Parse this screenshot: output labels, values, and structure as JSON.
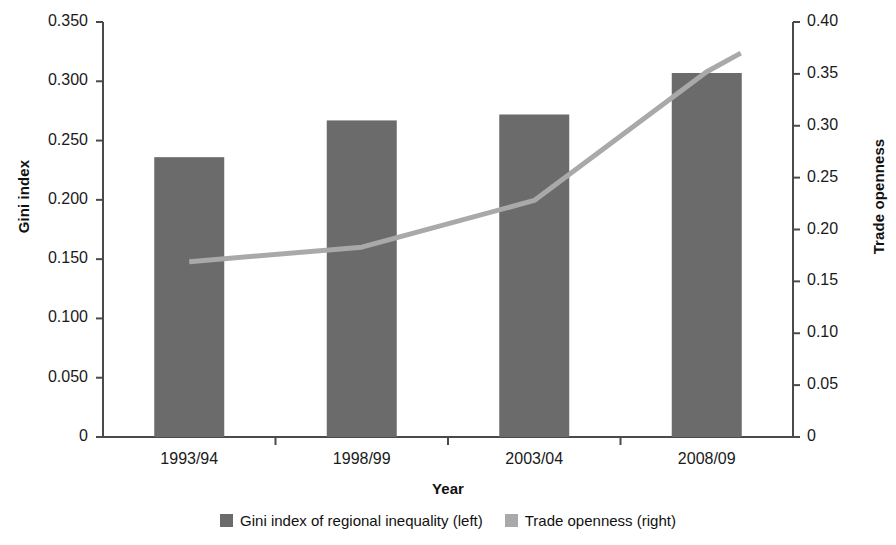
{
  "chart_data": {
    "type": "bar",
    "title": "",
    "subtitle": "",
    "xlabel": "Year",
    "ylabel": "Gini index",
    "y2label": "Trade openness",
    "categories": [
      "1993/94",
      "1998/99",
      "2003/04",
      "2008/09"
    ],
    "ylim": [
      0,
      0.35
    ],
    "y2lim": [
      0,
      0.4
    ],
    "yticks": [
      "0",
      "0.050",
      "0.100",
      "0.150",
      "0.200",
      "0.250",
      "0.300",
      "0.350"
    ],
    "ytick_values": [
      0,
      0.05,
      0.1,
      0.15,
      0.2,
      0.25,
      0.3,
      0.35
    ],
    "y2ticks": [
      "0",
      "0.05",
      "0.10",
      "0.15",
      "0.20",
      "0.25",
      "0.30",
      "0.35",
      "0.40"
    ],
    "y2tick_values": [
      0,
      0.05,
      0.1,
      0.15,
      0.2,
      0.25,
      0.3,
      0.35,
      0.4
    ],
    "grid": false,
    "legend_position": "bottom",
    "series": [
      {
        "name": "Gini index of regional inequality (left)",
        "type": "bar",
        "axis": "left",
        "color": "#6b6b6b",
        "values": [
          0.236,
          0.267,
          0.272,
          0.307
        ]
      },
      {
        "name": "Trade openness (right)",
        "type": "line",
        "axis": "right",
        "color": "#a9a9a9",
        "values": [
          0.169,
          0.183,
          0.228,
          0.352
        ],
        "line_extends_beyond_last_point": true,
        "line_end_value": 0.37
      }
    ]
  },
  "axes": {
    "left_title": "Gini index",
    "right_title": "Trade openness",
    "x_title": "Year"
  },
  "legend": {
    "items": [
      {
        "label": "Gini index of regional inequality (left)",
        "color": "#6b6b6b"
      },
      {
        "label": "Trade openness (right)",
        "color": "#a9a9a9"
      }
    ]
  }
}
